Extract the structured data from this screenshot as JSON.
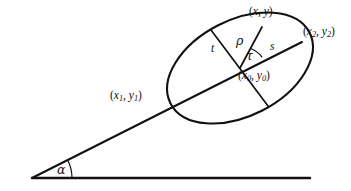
{
  "figure": {
    "name": "ellipse-on-inclined-line-diagram",
    "background_color": "#ffffff",
    "stroke_color": "#111111",
    "width": 351,
    "height": 191
  },
  "labels": {
    "point_xy": "(x, y)",
    "point_x2y2_open": "(x",
    "point_x2y2_sub1": "2",
    "point_x2y2_mid": ", y",
    "point_x2y2_sub2": "2",
    "point_x2y2_close": ")",
    "point_x1y1_open": "(x",
    "point_x1y1_sub1": "1",
    "point_x1y1_mid": ", y",
    "point_x1y1_sub2": "1",
    "point_x1y1_close": ")",
    "point_x0y0_open": "(x",
    "point_x0y0_sub1": "0",
    "point_x0y0_mid": ", y",
    "point_x0y0_sub2": "0",
    "point_x0y0_close": ")",
    "segment_t": "t",
    "segment_s": "s",
    "radius_rho": "ρ",
    "angle_tau": "τ",
    "angle_alpha": "α"
  },
  "geometry": {
    "ellipse": {
      "center_x": 240,
      "center_y": 68,
      "semi_major": 78,
      "semi_minor": 48,
      "rotation_deg": -27
    },
    "major_axis": {
      "x1": 32,
      "y1": 178,
      "x2": 302,
      "y2": 42
    },
    "baseline": {
      "x1": 32,
      "y1": 178,
      "x2": 310,
      "y2": 178
    },
    "minor_chord": {
      "x1": 211,
      "y1": 30,
      "x2": 268,
      "y2": 106
    },
    "radius_rho_line": {
      "x1": 240,
      "y1": 68,
      "x2": 262,
      "y2": 27
    },
    "angle_alpha_deg": 26,
    "angle_tau_deg": 38
  }
}
